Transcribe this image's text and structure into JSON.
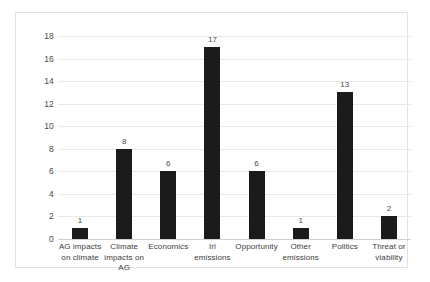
{
  "chart_data": {
    "type": "bar",
    "title": "",
    "xlabel": "",
    "ylabel": "",
    "ylim": [
      0,
      18
    ],
    "ytick_step": 2,
    "grid": true,
    "legend": "none",
    "bar_color": "#1b1b1b",
    "gridline_color": "#e8e8e8",
    "border_color": "#e2e2e2",
    "categories": [
      "AG impacts on climate",
      "Climate impacts on AG",
      "Economics",
      "Irl emissions",
      "Opportunity",
      "Other emissions",
      "Politics",
      "Threat or viability"
    ],
    "values": [
      1,
      8,
      6,
      17,
      6,
      1,
      13,
      2
    ],
    "data_labels": [
      "1",
      "8",
      "6",
      "17",
      "6",
      "1",
      "13",
      "2"
    ],
    "ytick_labels": [
      "0",
      "2",
      "4",
      "6",
      "8",
      "10",
      "12",
      "14",
      "16",
      "18"
    ],
    "yticks": [
      0,
      2,
      4,
      6,
      8,
      10,
      12,
      14,
      16,
      18
    ]
  }
}
